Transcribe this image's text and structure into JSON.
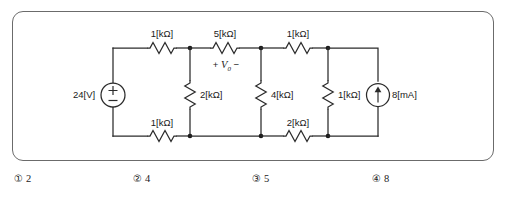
{
  "problem": {
    "frame": {
      "border_color": "#6b6b6b"
    },
    "wire_color": "#2b2b2b"
  },
  "circuit": {
    "voltage_source": {
      "label": "24[V]",
      "polarity_plus": "+",
      "polarity_minus": "−",
      "icon": "voltage-source-icon"
    },
    "current_source": {
      "label": "8[mA]",
      "icon": "current-source-icon",
      "direction": "up"
    },
    "measured_voltage": {
      "plus": "+",
      "symbol": "V",
      "subscript": "0",
      "minus": "−"
    },
    "resistors": [
      {
        "id": "r-top-left",
        "label": "1[kΩ]",
        "orientation": "horizontal"
      },
      {
        "id": "r-top-middle",
        "label": "5[kΩ]",
        "orientation": "horizontal"
      },
      {
        "id": "r-top-right",
        "label": "1[kΩ]",
        "orientation": "horizontal"
      },
      {
        "id": "r-shunt-2k",
        "label": "2[kΩ]",
        "orientation": "vertical"
      },
      {
        "id": "r-shunt-4k",
        "label": "4[kΩ]",
        "orientation": "vertical"
      },
      {
        "id": "r-shunt-1k",
        "label": "1[kΩ]",
        "orientation": "vertical"
      },
      {
        "id": "r-bottom-left",
        "label": "1[kΩ]",
        "orientation": "horizontal"
      },
      {
        "id": "r-bottom-right",
        "label": "2[kΩ]",
        "orientation": "horizontal"
      }
    ]
  },
  "answers": [
    {
      "marker": "①",
      "value": "2"
    },
    {
      "marker": "②",
      "value": "4"
    },
    {
      "marker": "③",
      "value": "5"
    },
    {
      "marker": "④",
      "value": "8"
    }
  ]
}
